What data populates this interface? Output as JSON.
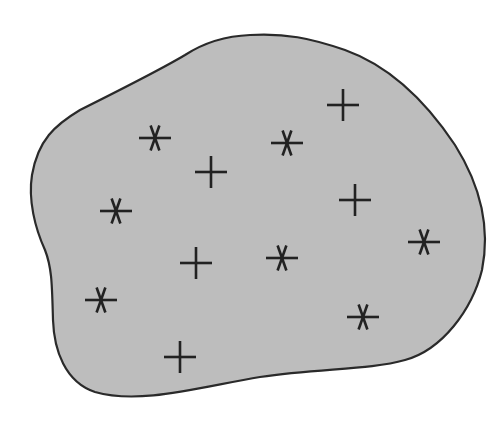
{
  "figure": {
    "description": "Irregular closed region containing two classes of points",
    "region": {
      "fill": "#bdbdbd",
      "stroke": "#2a2a2a",
      "path": "M 250 35 C 285 33, 310 38, 345 50 C 390 66, 425 100, 455 145 C 482 188, 490 230, 482 270 C 472 310, 442 350, 405 360 C 370 370, 320 368, 260 377 C 200 387, 140 405, 95 392 C 65 382, 54 350, 53 320 C 52 285, 52 268, 45 250 C 35 228, 28 200, 32 175 C 38 140, 55 125, 80 110 C 120 90, 160 70, 185 55 C 205 42, 225 36, 250 35 Z"
    },
    "marker_color": "#222222",
    "marker_types": {
      "plus": "plus-sign",
      "asterisk": "six-point-asterisk"
    },
    "points": [
      {
        "type": "plus",
        "x": 343,
        "y": 105
      },
      {
        "type": "asterisk",
        "x": 155,
        "y": 138
      },
      {
        "type": "asterisk",
        "x": 287,
        "y": 143
      },
      {
        "type": "plus",
        "x": 211,
        "y": 172
      },
      {
        "type": "plus",
        "x": 355,
        "y": 200
      },
      {
        "type": "asterisk",
        "x": 116,
        "y": 211
      },
      {
        "type": "asterisk",
        "x": 424,
        "y": 242
      },
      {
        "type": "asterisk",
        "x": 282,
        "y": 258
      },
      {
        "type": "plus",
        "x": 196,
        "y": 263
      },
      {
        "type": "asterisk",
        "x": 101,
        "y": 300
      },
      {
        "type": "asterisk",
        "x": 363,
        "y": 317
      },
      {
        "type": "plus",
        "x": 180,
        "y": 357
      }
    ],
    "counts": {
      "plus": 5,
      "asterisk": 7
    }
  }
}
